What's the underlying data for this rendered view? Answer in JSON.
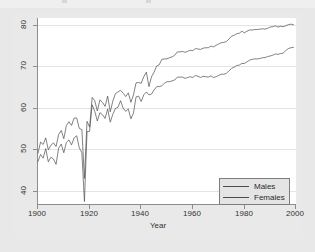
{
  "figure": {
    "background": "#e9e9e9",
    "plot_background": "#ffffff",
    "axis_color": "#8d8d8d",
    "grid_color": "#e4e4e4"
  },
  "axis": {
    "x_title": "Year",
    "y_title": "",
    "x_ticks": [
      "1900",
      "1920",
      "1940",
      "1960",
      "1980",
      "2000"
    ],
    "y_ticks": [
      "40",
      "50",
      "60",
      "70",
      "80"
    ]
  },
  "legend": {
    "items": [
      {
        "label": "Males",
        "color": "#4c4c4c"
      },
      {
        "label": "Females",
        "color": "#4c4c4c"
      }
    ]
  },
  "chart_data": {
    "type": "line",
    "title": "",
    "subtitle": "",
    "xlabel": "Year",
    "ylabel": "",
    "xlim": [
      1900,
      2000
    ],
    "ylim": [
      36,
      81
    ],
    "xticks": [
      1900,
      1920,
      1940,
      1960,
      1980,
      2000
    ],
    "yticks": [
      40,
      50,
      60,
      70,
      80
    ],
    "grid": "horizontal",
    "legend_position": "bottom-right",
    "x": [
      1900,
      1901,
      1902,
      1903,
      1904,
      1905,
      1906,
      1907,
      1908,
      1909,
      1910,
      1911,
      1912,
      1913,
      1914,
      1915,
      1916,
      1917,
      1918,
      1919,
      1920,
      1921,
      1922,
      1923,
      1924,
      1925,
      1926,
      1927,
      1928,
      1929,
      1930,
      1931,
      1932,
      1933,
      1934,
      1935,
      1936,
      1937,
      1938,
      1939,
      1940,
      1941,
      1942,
      1943,
      1944,
      1945,
      1946,
      1947,
      1948,
      1949,
      1950,
      1951,
      1952,
      1953,
      1954,
      1955,
      1956,
      1957,
      1958,
      1959,
      1960,
      1961,
      1962,
      1963,
      1964,
      1965,
      1966,
      1967,
      1968,
      1969,
      1970,
      1971,
      1972,
      1973,
      1974,
      1975,
      1976,
      1977,
      1978,
      1979,
      1980,
      1981,
      1982,
      1983,
      1984,
      1985,
      1986,
      1987,
      1988,
      1989,
      1990,
      1991,
      1992,
      1993,
      1994,
      1995,
      1996,
      1997,
      1998,
      1999
    ],
    "series": [
      {
        "name": "Males",
        "color": "#4c4c4c",
        "values": [
          46.3,
          48.0,
          47.1,
          49.4,
          46.2,
          47.3,
          46.9,
          45.6,
          49.5,
          50.5,
          48.4,
          50.9,
          51.5,
          50.3,
          52.0,
          52.5,
          49.6,
          48.4,
          36.6,
          53.5,
          53.6,
          60.0,
          58.4,
          56.1,
          58.1,
          57.6,
          56.7,
          59.0,
          55.8,
          57.7,
          59.1,
          59.4,
          61.0,
          59.2,
          58.4,
          59.0,
          56.6,
          58.0,
          61.9,
          62.1,
          60.8,
          62.4,
          63.1,
          62.4,
          62.6,
          63.6,
          64.4,
          64.4,
          64.6,
          65.2,
          65.6,
          65.6,
          65.8,
          66.0,
          66.7,
          66.7,
          66.7,
          66.4,
          66.6,
          66.8,
          66.6,
          67.1,
          66.9,
          66.6,
          66.9,
          66.8,
          66.7,
          67.0,
          66.6,
          66.8,
          67.1,
          67.4,
          67.4,
          67.6,
          68.2,
          68.8,
          69.1,
          69.5,
          69.6,
          70.0,
          70.0,
          70.4,
          70.8,
          71.0,
          71.1,
          71.1,
          71.2,
          71.4,
          71.4,
          71.7,
          71.8,
          72.0,
          72.3,
          72.2,
          72.4,
          72.5,
          73.1,
          73.6,
          73.8,
          73.9
        ]
      },
      {
        "name": "Females",
        "color": "#4c4c4c",
        "values": [
          48.3,
          51.0,
          50.4,
          52.0,
          49.1,
          50.2,
          50.8,
          49.9,
          52.8,
          53.8,
          51.8,
          55.0,
          55.9,
          55.0,
          56.8,
          56.8,
          54.3,
          54.0,
          42.2,
          56.0,
          54.6,
          61.8,
          61.0,
          58.5,
          61.2,
          60.6,
          59.6,
          62.1,
          58.3,
          60.9,
          62.7,
          63.1,
          63.5,
          62.8,
          62.0,
          62.9,
          60.6,
          62.4,
          65.3,
          65.4,
          65.2,
          66.8,
          67.9,
          64.4,
          66.8,
          67.9,
          69.4,
          69.7,
          71.0,
          71.1,
          71.1,
          71.4,
          71.6,
          72.0,
          72.8,
          72.8,
          72.9,
          72.7,
          72.9,
          73.2,
          73.1,
          73.6,
          73.5,
          73.4,
          73.7,
          73.8,
          73.8,
          74.2,
          74.0,
          74.4,
          74.7,
          75.0,
          75.1,
          75.3,
          75.9,
          76.6,
          76.8,
          77.2,
          77.3,
          77.8,
          77.4,
          77.8,
          78.1,
          78.1,
          78.2,
          78.2,
          78.3,
          78.4,
          78.3,
          78.5,
          78.8,
          78.9,
          79.1,
          78.8,
          79.0,
          78.9,
          79.1,
          79.4,
          79.5,
          79.4
        ]
      }
    ]
  }
}
